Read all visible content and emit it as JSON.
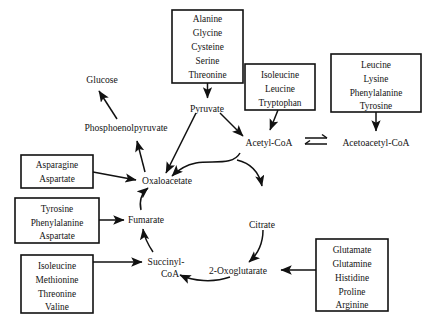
{
  "diagram": {
    "background_color": "#ffffff",
    "line_color": "#111111",
    "text_color": "#141414"
  },
  "amino_acid_groups": [
    {
      "id": "to-pyruvate",
      "lines": [
        "Alanine",
        "Glycine",
        "Cysteine",
        "Serine",
        "Threonine"
      ],
      "target": "Pyruvate"
    },
    {
      "id": "to-acetyl-coa",
      "lines": [
        "Isoleucine",
        "Leucine",
        "Tryptophan"
      ],
      "target": "Acetyl-CoA"
    },
    {
      "id": "to-acetoacetyl-coa",
      "lines": [
        "Leucine",
        "Lysine",
        "Phenylalanine",
        "Tyrosine"
      ],
      "target": "Acetoacetyl-CoA"
    },
    {
      "id": "to-oxaloacetate",
      "lines": [
        "Asparagine",
        "Aspartate"
      ],
      "target": "Oxaloacetate"
    },
    {
      "id": "to-fumarate",
      "lines": [
        "Tyrosine",
        "Phenylalanine",
        "Aspartate"
      ],
      "target": "Fumarate"
    },
    {
      "id": "to-succinyl-coa",
      "lines": [
        "Isoleucine",
        "Methionine",
        "Threonine",
        "Valine"
      ],
      "target": "Succinyl-CoA"
    },
    {
      "id": "to-2-oxoglutarate",
      "lines": [
        "Glutamate",
        "Glutamine",
        "Histidine",
        "Proline",
        "Arginine"
      ],
      "target": "2-Oxoglutarate"
    }
  ],
  "metabolites": {
    "glucose": "Glucose",
    "phosphoenolpyruvate": "Phosphoenolpyruvate",
    "pyruvate": "Pyruvate",
    "acetyl_coa": "Acetyl-CoA",
    "acetoacetyl_coa": "Acetoacetyl-CoA",
    "oxaloacetate": "Oxaloacetate",
    "citrate": "Citrate",
    "fumarate": "Fumarate",
    "succinyl_coa_line1": "Succinyl-",
    "succinyl_coa_line2": "CoA",
    "oxoglutarate": "2-Oxoglutarate"
  },
  "box_text": {
    "b1_l1": "Alanine",
    "b1_l2": "Glycine",
    "b1_l3": "Cysteine",
    "b1_l4": "Serine",
    "b1_l5": "Threonine",
    "b2_l1": "Isoleucine",
    "b2_l2": "Leucine",
    "b2_l3": "Tryptophan",
    "b3_l1": "Leucine",
    "b3_l2": "Lysine",
    "b3_l3": "Phenylalanine",
    "b3_l4": "Tyrosine",
    "b4_l1": "Asparagine",
    "b4_l2": "Aspartate",
    "b5_l1": "Tyrosine",
    "b5_l2": "Phenylalanine",
    "b5_l3": "Aspartate",
    "b6_l1": "Isoleucine",
    "b6_l2": "Methionine",
    "b6_l3": "Threonine",
    "b6_l4": "Valine",
    "b7_l1": "Glutamate",
    "b7_l2": "Glutamine",
    "b7_l3": "Histidine",
    "b7_l4": "Proline",
    "b7_l5": "Arginine"
  }
}
